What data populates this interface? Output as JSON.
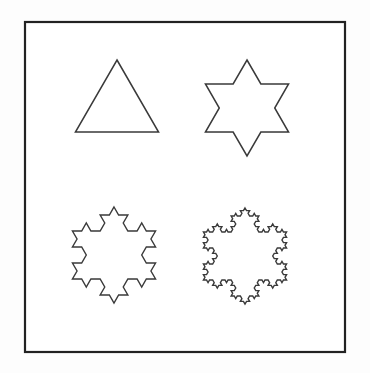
{
  "figure": {
    "background_color": "#fdfdfd",
    "panel_color": "#ffffff",
    "stroke_color": "#3a3a3a",
    "ghost_stroke_color": "#e8e8e8",
    "frame": {
      "name": "outer-border",
      "x": 25,
      "y": 22,
      "width": 320,
      "height": 330,
      "stroke_color": "#222222",
      "stroke_width": 2.2,
      "fill": "#ffffff"
    },
    "stages": [
      {
        "id": "stage-0",
        "label": "Stage 0",
        "shape_name": "equilateral-triangle",
        "iteration": 0,
        "segments": 3,
        "center_x": 117,
        "center_y": 108,
        "radius": 48,
        "rotation_deg": -90,
        "stroke_width": 1.5,
        "ghost": false
      },
      {
        "id": "stage-1",
        "label": "Stage 1",
        "shape_name": "hexagram-star-of-david",
        "iteration": 1,
        "segments": 12,
        "center_x": 247,
        "center_y": 108,
        "radius": 48,
        "rotation_deg": -90,
        "stroke_width": 1.5,
        "ghost": true
      },
      {
        "id": "stage-2",
        "label": "Stage 2",
        "shape_name": "koch-snowflake-iteration-2",
        "iteration": 2,
        "segments": 48,
        "center_x": 114,
        "center_y": 255,
        "radius": 48,
        "rotation_deg": -90,
        "stroke_width": 1.4,
        "ghost": true
      },
      {
        "id": "stage-3",
        "label": "Stage 3",
        "shape_name": "koch-snowflake-iteration-3",
        "iteration": 3,
        "segments": 192,
        "center_x": 245,
        "center_y": 256,
        "radius": 48,
        "rotation_deg": -90,
        "stroke_width": 1.4,
        "ghost": false
      }
    ]
  }
}
